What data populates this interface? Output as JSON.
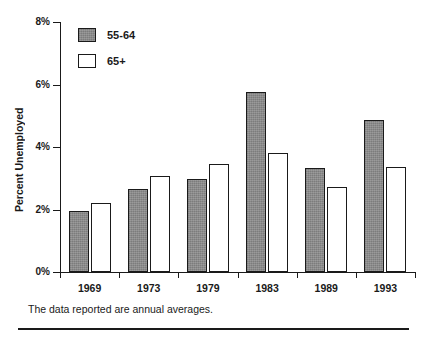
{
  "chart_data": {
    "type": "bar",
    "title": "",
    "xlabel": "",
    "ylabel": "Percent Unemployed",
    "categories": [
      "1969",
      "1973",
      "1979",
      "1983",
      "1989",
      "1993"
    ],
    "series": [
      {
        "name": "55-64",
        "values": [
          1.95,
          2.65,
          2.97,
          5.75,
          3.33,
          4.86
        ],
        "color": "#8a8a8a"
      },
      {
        "name": "65+",
        "values": [
          2.22,
          3.07,
          3.45,
          3.8,
          2.72,
          3.36
        ],
        "color": "#ffffff"
      }
    ],
    "ylim": [
      0,
      8
    ],
    "yticks": [
      0,
      2,
      4,
      6,
      8
    ],
    "ytick_labels": [
      "0%",
      "2%",
      "4%",
      "6%",
      "8%"
    ],
    "grid": false,
    "legend_position": "upper-left-inside",
    "annotations": [
      "The data reported are annual averages."
    ]
  },
  "footnote": "The data reported are annual averages."
}
